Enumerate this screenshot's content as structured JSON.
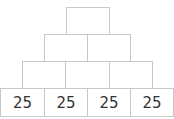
{
  "pyramid": {
    "rows": [
      {
        "cells": [
          ""
        ]
      },
      {
        "cells": [
          "",
          ""
        ]
      },
      {
        "cells": [
          "",
          "",
          ""
        ]
      },
      {
        "cells": [
          "25",
          "25",
          "25",
          "25"
        ]
      }
    ]
  }
}
